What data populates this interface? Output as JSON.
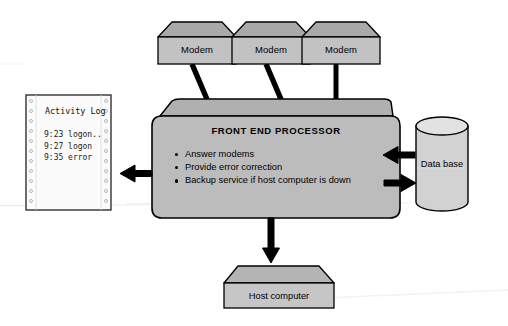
{
  "diagram": {
    "colors": {
      "shape_fill": "#b9b9b9",
      "shape_fill_light": "#c9c9c9",
      "shape_fill_dark": "#a6a6a6",
      "outline": "#000000",
      "paper_fill": "#fbfbfb",
      "connector": "#000000",
      "background": "#ffffff"
    },
    "modems": [
      {
        "label": "Modem"
      },
      {
        "label": "Modem"
      },
      {
        "label": "Modem"
      }
    ],
    "processor": {
      "title": "FRONT END PROCESSOR",
      "bullets": [
        "Answer modems",
        "Provide error correction",
        "Backup service if host computer is down"
      ]
    },
    "database": {
      "label": "Data base"
    },
    "host": {
      "label": "Host computer"
    },
    "activity_log": {
      "title": "Activity Log",
      "lines": [
        "9:23 logon..",
        "9:27 logon",
        "9:35 error"
      ]
    }
  }
}
